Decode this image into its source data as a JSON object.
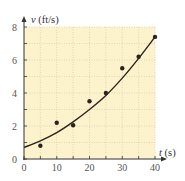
{
  "chart_data": {
    "type": "scatter",
    "title": "",
    "xlabel": "t (s)",
    "ylabel": "v (ft/s)",
    "xlabel_var": "t",
    "xlabel_unit": "(s)",
    "ylabel_var": "v",
    "ylabel_unit": "(ft/s)",
    "xlim": [
      0,
      40
    ],
    "ylim": [
      0,
      8
    ],
    "x_ticks": [
      0,
      10,
      20,
      30,
      40
    ],
    "y_ticks": [
      0,
      2,
      4,
      6,
      8
    ],
    "x_tick_labels": [
      "0",
      "10",
      "20",
      "30",
      "40"
    ],
    "y_tick_labels": [
      "0",
      "2",
      "4",
      "6",
      "8"
    ],
    "grid": true,
    "grid_style": "dotted",
    "minor_grid_x_step": 5,
    "minor_grid_y_step": 1,
    "legend": null,
    "series": [
      {
        "name": "measured",
        "kind": "scatter",
        "x": [
          5,
          10,
          15,
          20,
          25,
          30,
          35,
          40
        ],
        "y": [
          0.8,
          2.2,
          2.05,
          3.5,
          4.0,
          5.5,
          6.2,
          7.4
        ]
      },
      {
        "name": "fit curve",
        "kind": "line",
        "x": [
          0,
          5,
          10,
          15,
          20,
          25,
          30,
          35,
          40
        ],
        "y": [
          0.7,
          1.1,
          1.6,
          2.25,
          3.0,
          3.85,
          4.9,
          6.1,
          7.4
        ]
      }
    ]
  },
  "colors": {
    "plot_background": "#fcf3cd",
    "grid": "#d9cfa8",
    "axis": "#333333",
    "data": "#2a2420"
  }
}
